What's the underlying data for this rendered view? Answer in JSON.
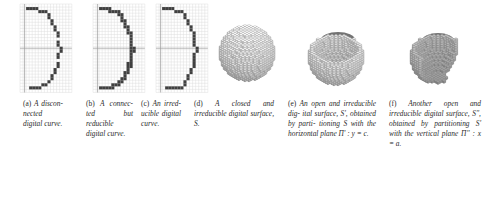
{
  "figure": {
    "panels": [
      {
        "id": "a",
        "type": "digital-curve-grid",
        "label": "(a)",
        "caption_lines": [
          "A",
          "discon-",
          "nected",
          "digital",
          "curve."
        ],
        "caption_text": "(a) A disconnected digital curve."
      },
      {
        "id": "b",
        "type": "digital-curve-grid",
        "label": "(b)",
        "caption_lines": [
          "A",
          "connec-",
          "ted but",
          "reducible",
          "digital",
          "curve."
        ],
        "caption_text": "(b) A connected but reducible digital curve."
      },
      {
        "id": "c",
        "type": "digital-curve-grid",
        "label": "(c)",
        "caption_lines": [
          "An",
          "irred-",
          "ucible",
          "digital",
          "curve."
        ],
        "caption_text": "(c) An irreducible digital curve."
      },
      {
        "id": "d",
        "type": "voxel-sphere-closed",
        "label": "(d)",
        "caption_lines": [
          "A closed and",
          "irreducible digital",
          "surface, S."
        ],
        "caption_text": "(d) A closed and irreducible digital surface, S."
      },
      {
        "id": "e",
        "type": "voxel-sphere-open-horizontal",
        "label": "(e)",
        "caption_lines": [
          "An open and",
          "irreducible dig-",
          "ital surface, S',",
          "obtained by parti-",
          "tioning S with the",
          "horizontal plane",
          "Π' : y = c."
        ],
        "caption_text": "(e) An open and irreducible digital surface, S', obtained by partitioning S with the horizontal plane Π' : y = c."
      },
      {
        "id": "f",
        "type": "voxel-sphere-open-vertical",
        "label": "(f)",
        "caption_lines": [
          "Another open",
          "and irreducible",
          "digital surface,",
          "S'', obtained by",
          "partitioning S'",
          "with the vertical",
          "plane Π'' : x = a."
        ],
        "caption_text": "(f) Another open and irreducible digital surface, S'', obtained by partitioning S' with the vertical plane Π'' : x = a."
      }
    ],
    "colors": {
      "grid_line": "#dcdcdc",
      "axis_line": "#9a9a9a",
      "curve_pixel": "#404040",
      "voxel_light": "#f2f2f2",
      "voxel_mid": "#c8c8c8",
      "voxel_dark": "#6e6e6e",
      "caption_text": "#2b2b2b",
      "background": "#ffffff"
    }
  },
  "chart_data": {
    "type": "scatter",
    "xlabel": "",
    "ylabel": "",
    "grid": true,
    "legend": "none",
    "panels": [
      {
        "name": "(a) disconnected digital curve",
        "grid_cols": 17,
        "grid_rows": 29,
        "axis_x_row": 14,
        "axis_y_col": 1,
        "points": [
          [
            2,
            1
          ],
          [
            3,
            1
          ],
          [
            4,
            1
          ],
          [
            5,
            1
          ],
          [
            6,
            2
          ],
          [
            7,
            2
          ],
          [
            8,
            2
          ],
          [
            9,
            3
          ],
          [
            9,
            4
          ],
          [
            10,
            5
          ],
          [
            10,
            6
          ],
          [
            11,
            7
          ],
          [
            11,
            8
          ],
          [
            12,
            9
          ],
          [
            12,
            10
          ],
          [
            12,
            12
          ],
          [
            12,
            13
          ],
          [
            13,
            14
          ],
          [
            13,
            15
          ],
          [
            12,
            16
          ],
          [
            12,
            17
          ],
          [
            12,
            19
          ],
          [
            12,
            20
          ],
          [
            11,
            21
          ],
          [
            11,
            22
          ],
          [
            10,
            23
          ],
          [
            10,
            24
          ],
          [
            9,
            25
          ],
          [
            7,
            26
          ],
          [
            8,
            26
          ],
          [
            3,
            27
          ],
          [
            4,
            27
          ],
          [
            5,
            27
          ],
          [
            6,
            27
          ]
        ]
      },
      {
        "name": "(b) connected but reducible digital curve",
        "grid_cols": 17,
        "grid_rows": 29,
        "axis_x_row": 14,
        "axis_y_col": 1,
        "points": [
          [
            2,
            1
          ],
          [
            3,
            1
          ],
          [
            4,
            1
          ],
          [
            5,
            1
          ],
          [
            5,
            2
          ],
          [
            6,
            2
          ],
          [
            7,
            2
          ],
          [
            8,
            2
          ],
          [
            8,
            3
          ],
          [
            9,
            3
          ],
          [
            9,
            4
          ],
          [
            9,
            5
          ],
          [
            10,
            5
          ],
          [
            10,
            6
          ],
          [
            10,
            7
          ],
          [
            11,
            7
          ],
          [
            11,
            8
          ],
          [
            11,
            9
          ],
          [
            12,
            9
          ],
          [
            12,
            10
          ],
          [
            12,
            11
          ],
          [
            12,
            12
          ],
          [
            12,
            13
          ],
          [
            12,
            14
          ],
          [
            13,
            14
          ],
          [
            13,
            15
          ],
          [
            12,
            15
          ],
          [
            12,
            16
          ],
          [
            12,
            17
          ],
          [
            12,
            18
          ],
          [
            11,
            19
          ],
          [
            12,
            19
          ],
          [
            12,
            20
          ],
          [
            11,
            20
          ],
          [
            11,
            21
          ],
          [
            11,
            22
          ],
          [
            10,
            22
          ],
          [
            10,
            23
          ],
          [
            10,
            24
          ],
          [
            9,
            24
          ],
          [
            9,
            25
          ],
          [
            8,
            25
          ],
          [
            8,
            26
          ],
          [
            7,
            26
          ],
          [
            6,
            26
          ],
          [
            5,
            27
          ],
          [
            6,
            27
          ],
          [
            4,
            27
          ],
          [
            3,
            27
          ],
          [
            2,
            27
          ]
        ]
      },
      {
        "name": "(c) irreducible digital curve",
        "grid_cols": 17,
        "grid_rows": 29,
        "axis_x_row": 14,
        "axis_y_col": 1,
        "points": [
          [
            2,
            1
          ],
          [
            3,
            1
          ],
          [
            4,
            1
          ],
          [
            5,
            1
          ],
          [
            6,
            2
          ],
          [
            7,
            2
          ],
          [
            8,
            2
          ],
          [
            9,
            3
          ],
          [
            9,
            4
          ],
          [
            10,
            5
          ],
          [
            10,
            6
          ],
          [
            11,
            7
          ],
          [
            11,
            8
          ],
          [
            12,
            9
          ],
          [
            12,
            10
          ],
          [
            12,
            11
          ],
          [
            12,
            12
          ],
          [
            12,
            13
          ],
          [
            13,
            14
          ],
          [
            13,
            15
          ],
          [
            12,
            16
          ],
          [
            12,
            17
          ],
          [
            12,
            18
          ],
          [
            12,
            19
          ],
          [
            12,
            20
          ],
          [
            11,
            21
          ],
          [
            11,
            22
          ],
          [
            10,
            23
          ],
          [
            10,
            24
          ],
          [
            9,
            25
          ],
          [
            9,
            26
          ],
          [
            7,
            27
          ],
          [
            8,
            27
          ],
          [
            3,
            27
          ],
          [
            4,
            27
          ],
          [
            5,
            27
          ],
          [
            6,
            27
          ]
        ]
      },
      {
        "name": "(d) closed irreducible digital surface S",
        "shape": "voxelized sphere, fully closed",
        "radius_voxels": 11
      },
      {
        "name": "(e) open irreducible digital surface S'",
        "shape": "voxelized sphere cut by horizontal plane y = c",
        "radius_voxels": 11
      },
      {
        "name": "(f) open irreducible digital surface S''",
        "shape": "voxelized sphere cut by horizontal plane y = c and vertical plane x = a",
        "radius_voxels": 11
      }
    ]
  }
}
